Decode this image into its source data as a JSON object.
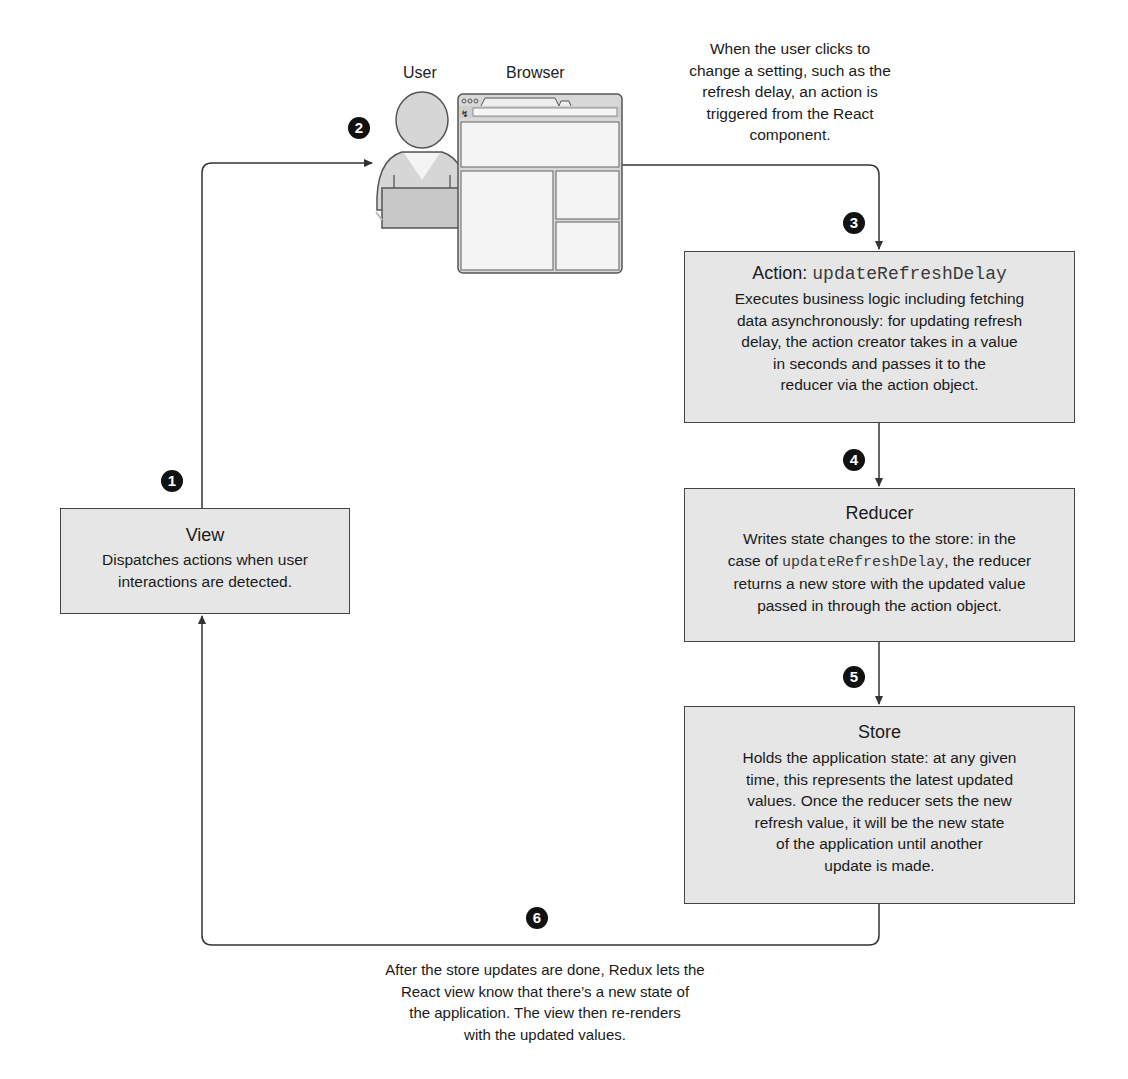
{
  "diagram": {
    "actors": {
      "user_label": "User",
      "browser_label": "Browser"
    },
    "steps": [
      {
        "number": "1",
        "label": "Dispatch from View"
      },
      {
        "number": "2",
        "label": "User interacts"
      },
      {
        "number": "3",
        "label": "Action triggered"
      },
      {
        "number": "4",
        "label": "Action to Reducer"
      },
      {
        "number": "5",
        "label": "Reducer to Store"
      },
      {
        "number": "6",
        "label": "Store notifies View"
      }
    ],
    "boxes": {
      "action": {
        "title_prefix": "Action: ",
        "title_code": "updateRefreshDelay",
        "lines": [
          "Executes business logic including fetching",
          "data asynchronously: for updating refresh",
          "delay, the action creator takes in a value",
          "in seconds and passes it to the",
          "reducer via the action object."
        ]
      },
      "reducer": {
        "title": "Reducer",
        "line1": "Writes state changes to the store: in the",
        "line2_prefix": "case of ",
        "line2_code": "updateRefreshDelay",
        "line2_suffix": ", the reducer",
        "line3": "returns a new store with the updated value",
        "line4": "passed in through the action object."
      },
      "store": {
        "title": "Store",
        "lines": [
          "Holds the application state: at any given",
          "time, this represents the latest updated",
          "values. Once the reducer sets the new",
          "refresh value, it will be the new state",
          "of the application until another",
          "update is made."
        ]
      },
      "view": {
        "title": "View",
        "lines": [
          "Dispatches actions when user",
          "interactions are detected."
        ]
      }
    },
    "captions": {
      "top": [
        "When the user clicks to",
        "change a setting, such as the",
        "refresh delay, an action is",
        "triggered from the React",
        "component."
      ],
      "bottom": [
        "After the store updates are done, Redux lets the",
        "React view know that there’s a new state of",
        "the application. The view then re-renders",
        "with the updated values."
      ]
    },
    "colors": {
      "box_fill": "#e6e6e6",
      "box_border": "#444444",
      "badge_fill": "#111111",
      "line": "#333333"
    }
  }
}
